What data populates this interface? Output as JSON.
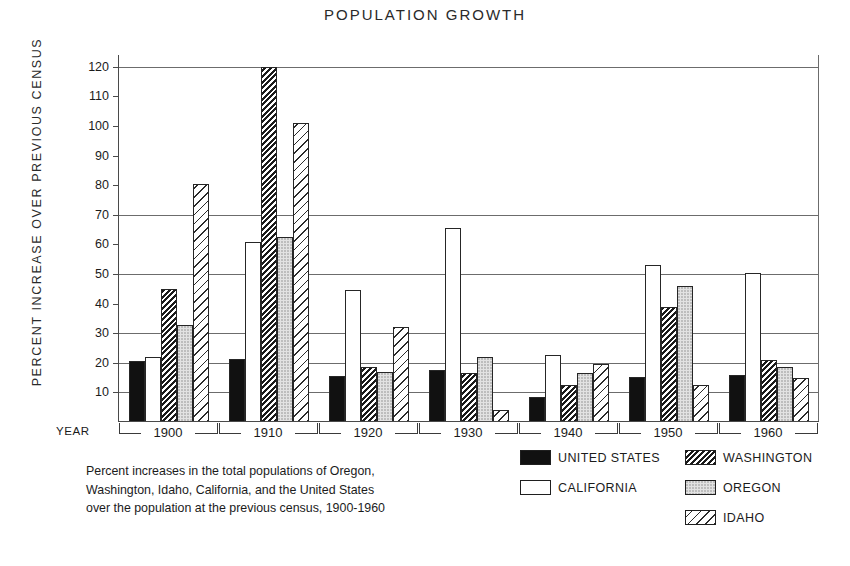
{
  "chart_data": {
    "type": "bar",
    "title": "POPULATION GROWTH",
    "xlabel": "YEAR",
    "ylabel": "PERCENT INCREASE OVER PREVIOUS CENSUS",
    "ylim": [
      0,
      124
    ],
    "yticks": [
      10,
      20,
      30,
      40,
      50,
      60,
      70,
      80,
      90,
      100,
      110,
      120
    ],
    "gridlines": [
      10,
      20,
      30,
      50,
      70,
      120
    ],
    "grid": true,
    "legend_position": "bottom-right",
    "categories": [
      "1900",
      "1910",
      "1920",
      "1930",
      "1940",
      "1950",
      "1960"
    ],
    "series": [
      {
        "name": "UNITED STATES",
        "key": "us",
        "pattern": "solid-black",
        "values": [
          20.7,
          21.4,
          15.5,
          17.5,
          8.5,
          15.2,
          15.8
        ]
      },
      {
        "name": "CALIFORNIA",
        "key": "ca",
        "pattern": "white-open",
        "values": [
          21.8,
          60.8,
          44.5,
          65.5,
          22.5,
          53.0,
          50.5
        ]
      },
      {
        "name": "WASHINGTON",
        "key": "wa",
        "pattern": "dense-diagonal-hatch",
        "values": [
          45.0,
          120.0,
          18.5,
          16.5,
          12.5,
          39.0,
          21.0
        ]
      },
      {
        "name": "OREGON",
        "key": "or",
        "pattern": "stipple-dots",
        "values": [
          32.8,
          62.5,
          17.0,
          21.8,
          16.5,
          46.0,
          18.7
        ]
      },
      {
        "name": "IDAHO",
        "key": "id",
        "pattern": "wide-diagonal-hatch",
        "values": [
          80.5,
          101.0,
          32.0,
          4.0,
          19.5,
          12.5,
          15.0
        ]
      }
    ],
    "annotations": [
      "Percent increases in the total populations of Oregon,",
      "Washington, Idaho, California, and the United States",
      "over the population at the previous census, 1900-1960"
    ]
  },
  "legend": {
    "entries": [
      {
        "label": "UNITED STATES",
        "swatch": "solid-black-swatch"
      },
      {
        "label": "WASHINGTON",
        "swatch": "dense-hatch-swatch"
      },
      {
        "label": "CALIFORNIA",
        "swatch": "white-open-swatch"
      },
      {
        "label": "OREGON",
        "swatch": "stipple-swatch"
      },
      {
        "label": "IDAHO",
        "swatch": "wide-hatch-swatch"
      }
    ]
  },
  "colors": {
    "ink": "#1b1b1b",
    "axis": "#4a4a4a",
    "grid": "#6c6c6c",
    "background": "#ffffff",
    "series_us": "#111111",
    "series_ca": "#ffffff",
    "series_wa": "#1a1a1a",
    "series_or": "#e2e2e2",
    "series_id": "#2b2b2b"
  }
}
